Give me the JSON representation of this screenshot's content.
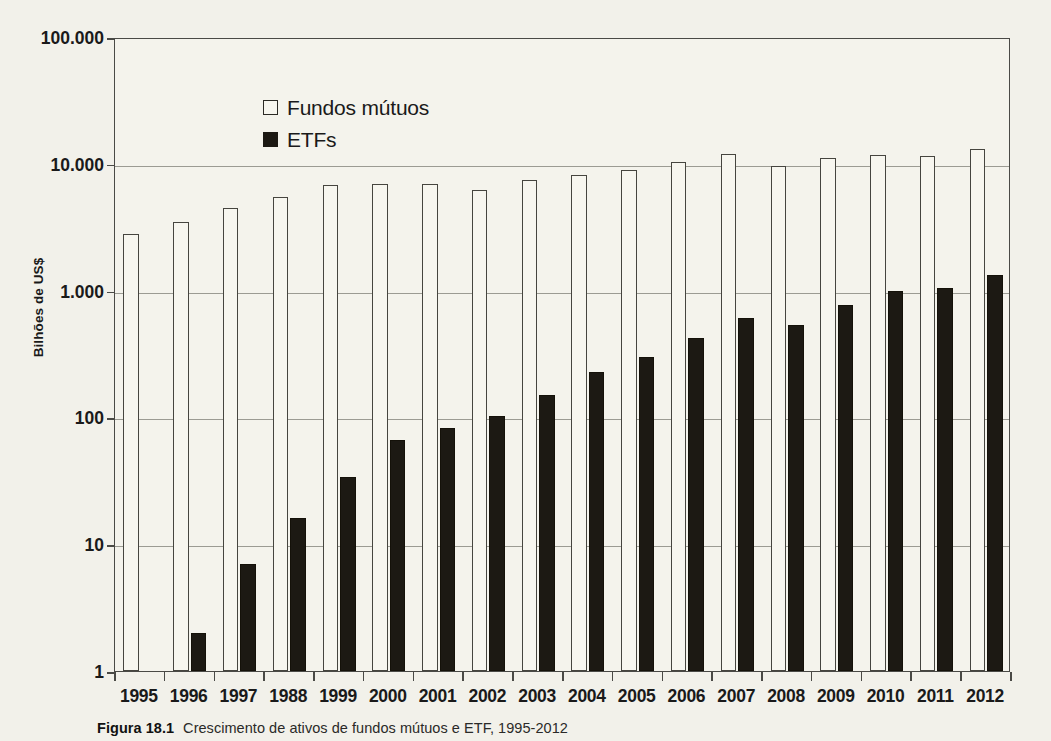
{
  "figure": {
    "caption_label": "Figura 18.1",
    "caption_text": "Crescimento de ativos de fundos mútuos e ETF, 1995-2012"
  },
  "legend": {
    "position": "top-left-inside",
    "entries": [
      {
        "label": "Fundos mútuos",
        "swatch": "open-square",
        "color": "#f7f6ef"
      },
      {
        "label": "ETFs",
        "swatch": "filled-square",
        "color": "#1c1913"
      }
    ]
  },
  "axes": {
    "y_title": "Bilhões de US$",
    "y_ticks": [
      "100.000",
      "10.000",
      "1.000",
      "100",
      "10",
      "1"
    ],
    "y_scale": "log",
    "x_title": ""
  },
  "chart_data": {
    "type": "bar",
    "title": "Crescimento de ativos de fundos mútuos e ETF, 1995-2012",
    "xlabel": "",
    "ylabel": "Bilhões de US$",
    "yscale": "log",
    "ylim": [
      1,
      100000
    ],
    "ytick_values": [
      1,
      10,
      100,
      1000,
      10000,
      100000
    ],
    "ytick_labels": [
      "1",
      "10",
      "100",
      "1.000",
      "10.000",
      "100.000"
    ],
    "grid": true,
    "legend": "upper left",
    "categories": [
      "1995",
      "1996",
      "1997",
      "1988",
      "1999",
      "2000",
      "2001",
      "2002",
      "2003",
      "2004",
      "2005",
      "2006",
      "2007",
      "2008",
      "2009",
      "2010",
      "2011",
      "2012"
    ],
    "series": [
      {
        "name": "Fundos mútuos",
        "color": "#f7f6ef",
        "values": [
          2800,
          3500,
          4500,
          5500,
          6800,
          6900,
          6900,
          6200,
          7400,
          8100,
          8900,
          10400,
          12000,
          9600,
          11100,
          11800,
          11600,
          13000
        ]
      },
      {
        "name": "ETFs",
        "color": "#1c1913",
        "values": [
          null,
          2,
          7,
          16,
          34,
          66,
          83,
          102,
          151,
          228,
          301,
          423,
          608,
          531,
          777,
          992,
          1048,
          1337
        ]
      }
    ]
  }
}
